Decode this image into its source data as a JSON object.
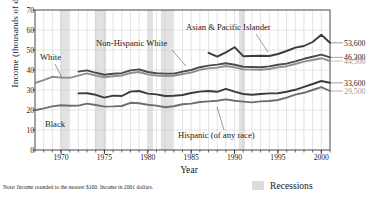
{
  "figure": {
    "note": "Note: Income rounded to the nearest $100. Income in 2001 dollars.",
    "legend_label": "Recessions",
    "legend_swatch_color": "#dcdcdc"
  },
  "chart_data": {
    "type": "line",
    "title": "",
    "xlabel": "Year",
    "ylabel": "Income (thousands of dollars)",
    "xlim": [
      1967,
      2001
    ],
    "ylim": [
      0,
      70
    ],
    "yticks": [
      0,
      10,
      20,
      30,
      40,
      50,
      60,
      70
    ],
    "xticks": [
      1970,
      1975,
      1980,
      1985,
      1990,
      1995,
      2000
    ],
    "grid": true,
    "grid_spacing_years": 1,
    "legend_position": "inline-annotations",
    "recessions": [
      {
        "start": 1969.9,
        "end": 1970.9
      },
      {
        "start": 1973.9,
        "end": 1975.2
      },
      {
        "start": 1980.0,
        "end": 1980.6
      },
      {
        "start": 1981.5,
        "end": 1982.9
      },
      {
        "start": 1990.5,
        "end": 1991.2
      },
      {
        "start": 2001.2,
        "end": 2001.9
      }
    ],
    "series": [
      {
        "name": "Asian & Pacific Islander",
        "color": "#3b3b3b",
        "end_value_label": "53,600",
        "end_value": 53600,
        "label_pos": {
          "x": 186,
          "y": 28
        },
        "leader": {
          "x1": 256,
          "y1": 34,
          "x2": 268,
          "y2": 52
        },
        "x": [
          1987,
          1988,
          1989,
          1990,
          1991,
          1992,
          1993,
          1994,
          1995,
          1996,
          1997,
          1998,
          1999,
          2000,
          2001
        ],
        "values": [
          48.6,
          46.7,
          48.8,
          51.4,
          46.9,
          47.0,
          47.1,
          47.0,
          48.0,
          49.5,
          51.2,
          52.0,
          54.0,
          57.6,
          53.6
        ]
      },
      {
        "name": "Non-Hispanic White",
        "color": "#4a4a4a",
        "end_value_label": "46,300",
        "end_value": 46300,
        "label_pos": {
          "x": 96,
          "y": 44
        },
        "leader": {
          "x1": 172,
          "y1": 50,
          "x2": 186,
          "y2": 66
        },
        "x": [
          1972,
          1973,
          1974,
          1975,
          1976,
          1977,
          1978,
          1979,
          1980,
          1981,
          1982,
          1983,
          1984,
          1985,
          1986,
          1987,
          1988,
          1989,
          1990,
          1991,
          1992,
          1993,
          1994,
          1995,
          1996,
          1997,
          1998,
          1999,
          2000,
          2001
        ],
        "values": [
          39.2,
          39.8,
          38.6,
          37.6,
          38.1,
          38.4,
          39.8,
          40.3,
          39.0,
          38.4,
          38.2,
          38.2,
          39.2,
          40.0,
          41.4,
          42.2,
          42.7,
          43.4,
          42.6,
          41.6,
          41.5,
          41.4,
          41.8,
          42.6,
          43.2,
          44.3,
          45.6,
          46.6,
          47.7,
          46.3
        ]
      },
      {
        "name": "White",
        "color": "#8e8e8e",
        "end_value_label": "44,500",
        "end_value": 44500,
        "label_pos": {
          "x": 40,
          "y": 58
        },
        "leader": {
          "x1": 55,
          "y1": 64,
          "x2": 62,
          "y2": 78
        },
        "x": [
          1967,
          1968,
          1969,
          1970,
          1971,
          1972,
          1973,
          1974,
          1975,
          1976,
          1977,
          1978,
          1979,
          1980,
          1981,
          1982,
          1983,
          1984,
          1985,
          1986,
          1987,
          1988,
          1989,
          1990,
          1991,
          1992,
          1993,
          1994,
          1995,
          1996,
          1997,
          1998,
          1999,
          2000,
          2001
        ],
        "values": [
          33.5,
          34.9,
          36.6,
          36.2,
          36.1,
          37.2,
          38.3,
          37.2,
          36.4,
          36.9,
          37.2,
          38.5,
          39.0,
          37.8,
          37.2,
          37.0,
          37.1,
          38.0,
          38.7,
          40.1,
          40.8,
          41.2,
          42.0,
          41.3,
          40.3,
          40.2,
          40.1,
          40.5,
          41.3,
          41.9,
          43.0,
          44.2,
          45.0,
          45.9,
          44.5
        ]
      },
      {
        "name": "Black",
        "color": "#3b3b3b",
        "end_value_label": "33,600",
        "end_value": 33600,
        "label_pos": {
          "x": 45,
          "y": 124
        },
        "leader": null,
        "x": [
          1972,
          1973,
          1974,
          1975,
          1976,
          1977,
          1978,
          1979,
          1980,
          1981,
          1982,
          1983,
          1984,
          1985,
          1986,
          1987,
          1988,
          1989,
          1990,
          1991,
          1992,
          1993,
          1994,
          1995,
          1996,
          1997,
          1998,
          1999,
          2000,
          2001
        ],
        "values": [
          28.3,
          28.4,
          27.6,
          26.2,
          27.2,
          27.0,
          29.2,
          29.5,
          28.2,
          27.8,
          27.0,
          27.1,
          27.5,
          28.5,
          29.2,
          29.5,
          29.1,
          30.6,
          29.2,
          28.0,
          27.6,
          28.0,
          28.3,
          28.4,
          29.1,
          30.1,
          31.6,
          33.0,
          34.5,
          33.6
        ]
      },
      {
        "name": "Hispanic (of any race)",
        "color": "#6e6e6e",
        "end_value_label": "29,500",
        "end_value": 29500,
        "label_pos": {
          "x": 178,
          "y": 135
        },
        "leader": {
          "x1": 224,
          "y1": 130,
          "x2": 217,
          "y2": 107
        },
        "x": [
          1967,
          1968,
          1969,
          1970,
          1971,
          1972,
          1973,
          1974,
          1975,
          1976,
          1977,
          1978,
          1979,
          1980,
          1981,
          1982,
          1983,
          1984,
          1985,
          1986,
          1987,
          1988,
          1989,
          1990,
          1991,
          1992,
          1993,
          1994,
          1995,
          1996,
          1997,
          1998,
          1999,
          2000,
          2001
        ],
        "values": [
          19.9,
          20.8,
          21.8,
          22.4,
          22.1,
          22.2,
          23.2,
          22.5,
          21.7,
          21.8,
          22.0,
          23.6,
          23.4,
          22.6,
          22.2,
          21.4,
          21.9,
          22.9,
          23.2,
          24.0,
          24.3,
          24.6,
          25.3,
          24.6,
          24.2,
          23.8,
          24.3,
          24.5,
          25.0,
          26.2,
          27.7,
          28.6,
          30.0,
          31.4,
          29.5
        ]
      }
    ]
  },
  "annotations": {
    "asian_pacific_islander": "Asian & Pacific Islander",
    "non_hispanic_white": "Non-Hispanic White",
    "white": "White",
    "black": "Black",
    "hispanic": "Hispanic (of any race)"
  }
}
